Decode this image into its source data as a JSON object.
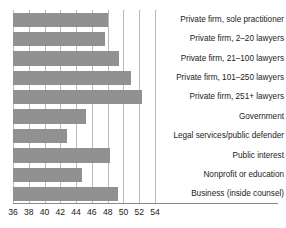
{
  "chart_data": {
    "type": "bar",
    "orientation": "horizontal",
    "title": "",
    "subtitle": "",
    "xlabel": "",
    "ylabel": "",
    "xlim": [
      36,
      54
    ],
    "xticks": [
      36,
      38,
      40,
      42,
      44,
      46,
      48,
      50,
      52,
      54
    ],
    "grid": true,
    "legend": false,
    "bar_color": "#919191",
    "gridline_color": "#b9b9b9",
    "axis_color": "#8a8a8a",
    "categories": [
      "Private firm, sole practitioner",
      "Private firm, 2–20 lawyers",
      "Private firm, 21–100 lawyers",
      "Private firm, 101–250 lawyers",
      "Private firm, 251+ lawyers",
      "Government",
      "Legal services/public defender",
      "Public interest",
      "Nonprofit or education",
      "Business (inside counsel)"
    ],
    "values": [
      48.0,
      47.6,
      49.4,
      51.0,
      52.3,
      45.3,
      42.8,
      48.3,
      44.7,
      49.3
    ]
  }
}
